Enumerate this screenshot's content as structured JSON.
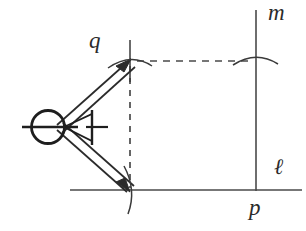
{
  "figure": {
    "type": "line-diagram",
    "canvas": {
      "width": 306,
      "height": 231
    },
    "colors": {
      "background": "#ffffff",
      "stroke": "#3a3a3a",
      "stroke_dark": "#1e1e1e",
      "dashed": "#4a4a4a",
      "label": "#2b2b2b"
    },
    "labels": [
      {
        "name": "label-q",
        "text": "q",
        "x": 89,
        "y": 29,
        "font_size": 23
      },
      {
        "name": "label-m",
        "text": "m",
        "x": 268,
        "y": 1,
        "font_size": 23
      },
      {
        "name": "label-l",
        "text": "ℓ",
        "x": 274,
        "y": 156,
        "font_size": 22
      },
      {
        "name": "label-p",
        "text": "p",
        "x": 249,
        "y": 196,
        "font_size": 23
      }
    ],
    "lines": {
      "baseline_l": {
        "x1": 70,
        "y1": 190,
        "x2": 302,
        "y2": 190
      },
      "vertical_m": {
        "x1": 256,
        "y1": 10,
        "x2": 256,
        "y2": 191
      },
      "dashed_vertical": {
        "x1": 130,
        "y1": 64,
        "x2": 130,
        "y2": 189
      },
      "dashed_horizontal": {
        "x1": 136,
        "y1": 61,
        "x2": 252,
        "y2": 61
      },
      "tick_q": {
        "x1": 130,
        "y1": 42,
        "x2": 130,
        "y2": 80
      }
    },
    "compass": {
      "pivot": {
        "cx": 48,
        "cy": 127,
        "r": 17
      },
      "crossbar": {
        "x1": 22,
        "y1": 127,
        "x2": 75,
        "y2": 127
      },
      "arrowhead_tip": {
        "x": 79,
        "y": 127
      },
      "arm_upper_to": {
        "x": 130,
        "y": 62
      },
      "arm_lower_to": {
        "x": 130,
        "y": 190
      }
    },
    "arcs": [
      {
        "name": "arc-top-vertex",
        "cx": 130,
        "cy": 62,
        "note": "arc crossing point q"
      },
      {
        "name": "arc-bottom-vertex",
        "cx": 130,
        "cy": 190,
        "note": "arc crossing line l"
      },
      {
        "name": "arc-on-m",
        "cx": 256,
        "cy": 61,
        "note": "arc crossing line m"
      }
    ]
  }
}
